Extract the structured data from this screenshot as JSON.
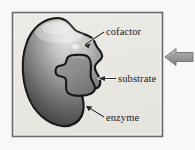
{
  "figure": {
    "kind": "biology-diagram",
    "labels": {
      "cofactor": "cofactor",
      "substrate": "substrate",
      "enzyme": "enzyme"
    },
    "frame": {
      "border_color": "#6d6d72",
      "fill_color": "#ebe9e4",
      "x": 12,
      "y": 12,
      "width": 151,
      "height": 125
    },
    "parts": [
      {
        "name": "enzyme",
        "label": "enzyme",
        "shape": "kidney-bean blob with active-site notch on right",
        "fill_light": "#d9d9d9",
        "fill_dark": "#3b3b3b",
        "outline_color": "#191919"
      },
      {
        "name": "substrate",
        "label": "substrate",
        "shape": "cross / puzzle-piece",
        "fill_color": "#8e8e8e",
        "outline_color": "#191919"
      },
      {
        "name": "cofactor",
        "label": "cofactor",
        "shape": "small rounded blob",
        "fill_color": "#cfcfcb",
        "outline_color": "#191919"
      }
    ],
    "pointer_arrow": {
      "name": "callout-arrow",
      "direction": "left",
      "fill_color": "#9a9a9a",
      "outline_color": "#6f6f6f"
    },
    "background_color": "#f8f8f7"
  }
}
